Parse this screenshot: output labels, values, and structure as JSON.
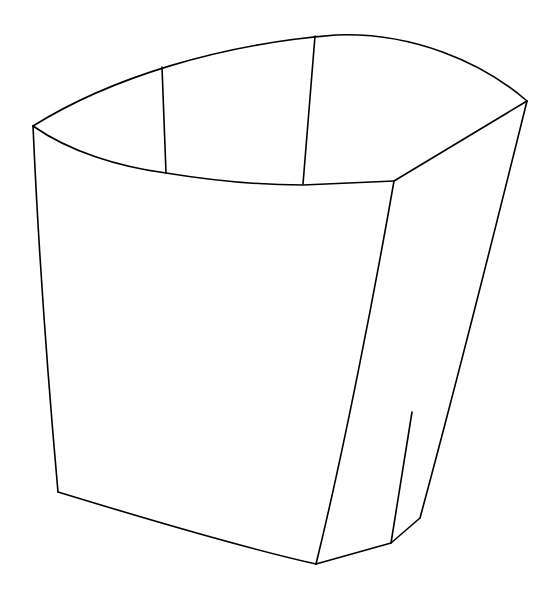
{
  "image": {
    "title": "Open Carton Line Drawing",
    "subject": "french-fry carton",
    "style": "black outline line art on white background",
    "width": 560,
    "height": 598,
    "background_color": "#ffffff",
    "stroke_color": "#000000",
    "stroke_width": 1.6,
    "fill_color": "#ffffff"
  },
  "geometry": {
    "vertices": {
      "rim_left_corner": [
        33,
        126
      ],
      "rim_outer_peak": [
        336,
        35
      ],
      "rim_right_corner": [
        527,
        101
      ],
      "rim_inner_right_corner": [
        394,
        181
      ],
      "inner_rim_left_dip": [
        166,
        173
      ],
      "inner_rim_mid": [
        303,
        185
      ],
      "left_panel_bottom": [
        58,
        492
      ],
      "bottom_center_vertex": [
        316,
        564
      ],
      "right_flap_bottom_vertex": [
        420,
        518
      ],
      "crease_top": [
        412,
        412
      ],
      "crease_bottom": [
        391,
        543
      ],
      "left_score_top": [
        162,
        67
      ],
      "left_score_bottom": [
        166,
        173
      ],
      "right_score_top": [
        315,
        36
      ],
      "right_score_bottom": [
        303,
        184
      ]
    },
    "paths": {
      "outer_rim": "M 33 126 C 110 78, 220 44, 336 35 C 412 32, 482 62, 527 101",
      "inner_rim": "M 33 126 C 70 152, 120 167, 166 173 C 215 181, 262 185, 303 185 L 394 181",
      "left_body_edge": "M 33 126 C 38 240, 48 380, 58 492",
      "bottom_curve": "M 58 492 C 130 514, 235 546, 316 564",
      "front_right_edge": "M 394 181 C 375 290, 344 450, 316 564",
      "bottom_right_edge": "M 316 564 L 391 543",
      "flap_lower_edge": "M 391 543 L 420 518",
      "right_outer_edge": "M 527 101 C 495 230, 452 400, 420 518",
      "left_score_line": "M 162 67 L 166 173",
      "right_score_line": "M 315 36 L 303 184",
      "crease_line": "M 412 412 L 391 543",
      "rim_corner_link": "M 394 181 L 527 101"
    },
    "faces": {
      "front_panel": "M 33 126 C 70 152, 120 167, 166 173 C 215 181, 262 185, 303 185 L 394 181 C 375 290, 344 450, 316 564 C 235 546, 130 514, 58 492 C 48 380, 38 240, 33 126 Z",
      "right_panel": "M 394 181 L 527 101 C 495 230, 452 400, 420 518 L 391 543 L 316 564 C 344 450, 375 290, 394 181 Z",
      "rim_band": "M 33 126 C 110 78, 220 44, 336 35 C 412 32, 482 62, 527 101 L 394 181 L 303 185 C 262 185, 215 181, 166 173 C 120 167, 70 152, 33 126 Z"
    }
  },
  "parts": [
    {
      "id": "rim-band",
      "label": "Carton rim band (top opening)"
    },
    {
      "id": "front-panel",
      "label": "Front panel"
    },
    {
      "id": "right-panel",
      "label": "Right side panel"
    },
    {
      "id": "left-score-line",
      "label": "Left rim fold line"
    },
    {
      "id": "right-score-line",
      "label": "Right rim fold line"
    },
    {
      "id": "crease-line",
      "label": "Lower side crease mark"
    }
  ]
}
